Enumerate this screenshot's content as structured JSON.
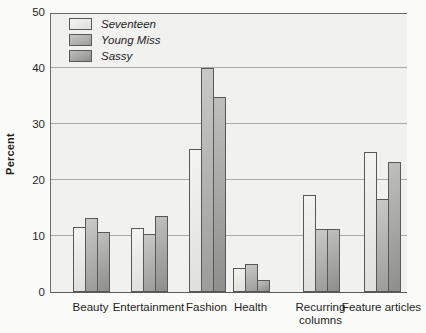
{
  "figure": {
    "background": "#fbfbf9",
    "plot_background": "#f1f1ef",
    "frame_color": "#6a6a6a",
    "gridline_color": "#a9a9a7",
    "bar_outline_color": "#58585a"
  },
  "chart_data": {
    "type": "bar",
    "title": "",
    "xlabel": "",
    "ylabel": "Percent",
    "ylim": [
      0,
      50
    ],
    "yticks": [
      0,
      10,
      20,
      30,
      40,
      50
    ],
    "grid": "horizontal",
    "legend_position": "top-left",
    "categories": [
      "Beauty",
      "Entertainment",
      "Fashion",
      "Health",
      "Recurring columns",
      "Feature articles"
    ],
    "series": [
      {
        "name": "Seventeen",
        "values": [
          11.2,
          11.0,
          25.2,
          4.0,
          17.0,
          24.6
        ],
        "fill_light": "#f4f4f2",
        "fill_dark": "#dfdfdb"
      },
      {
        "name": "Young Miss",
        "values": [
          12.9,
          10.0,
          39.7,
          4.7,
          10.9,
          16.3
        ],
        "fill_light": "#c9c9c7",
        "fill_dark": "#9c9c9a"
      },
      {
        "name": "Sassy",
        "values": [
          10.3,
          13.3,
          34.5,
          1.7,
          10.9,
          22.9
        ],
        "fill_light": "#bfbfbd",
        "fill_dark": "#8e8e8c"
      }
    ]
  }
}
